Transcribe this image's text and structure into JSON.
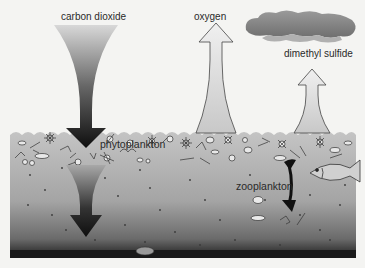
{
  "diagram": {
    "labels": {
      "carbon_dioxide": "carbon dioxide",
      "oxygen": "oxygen",
      "dimethyl_sulfide": "dimethyl sulfide",
      "phytoplankton": "phytoplankton",
      "zooplankton": "zooplankton"
    },
    "colors": {
      "background": "#f4f4f2",
      "ocean_top": "#b9b9b9",
      "ocean_bottom": "#202020",
      "arrow_dark": "#111111",
      "arrow_light": "#e2e2e2",
      "cloud": "#8a8a8a"
    },
    "icons": [
      "down-arrow-icon",
      "up-arrow-icon",
      "cloud-icon",
      "fish-icon",
      "double-arrow-icon",
      "shell-icon"
    ]
  }
}
